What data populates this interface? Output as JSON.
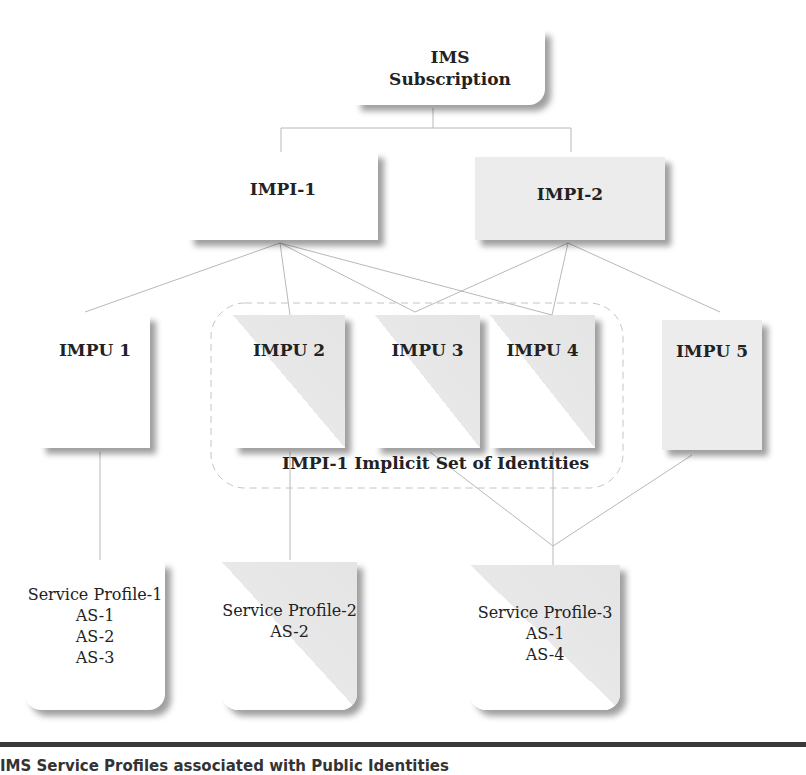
{
  "diagram": {
    "root": {
      "line1": "IMS",
      "line2": "Subscription"
    },
    "private_ids": [
      {
        "label": "IMPI-1"
      },
      {
        "label": "IMPI-2"
      }
    ],
    "public_ids": [
      {
        "label": "IMPU 1"
      },
      {
        "label": "IMPU 2"
      },
      {
        "label": "IMPU 3"
      },
      {
        "label": "IMPU 4"
      },
      {
        "label": "IMPU 5"
      }
    ],
    "implicit_set_label": "IMPI-1 Implicit Set of Identities",
    "service_profiles": [
      {
        "title": "Service Profile-1",
        "servers": [
          "AS-1",
          "AS-2",
          "AS-3"
        ]
      },
      {
        "title": "Service Profile-2",
        "servers": [
          "AS-2"
        ]
      },
      {
        "title": "Service Profile-3",
        "servers": [
          "AS-1",
          "AS-4"
        ]
      }
    ],
    "links": {
      "subscription_to_impi": [
        "IMPI-1",
        "IMPI-2"
      ],
      "IMPI-1": [
        "IMPU 1",
        "IMPU 2",
        "IMPU 3",
        "IMPU 4"
      ],
      "IMPI-2": [
        "IMPU 3",
        "IMPU 4",
        "IMPU 5"
      ],
      "IMPU 1": [
        "Service Profile-1"
      ],
      "IMPU 2": [
        "Service Profile-2"
      ],
      "IMPU 3": [
        "Service Profile-3"
      ],
      "IMPU 4": [
        "Service Profile-3"
      ],
      "IMPU 5": [
        "Service Profile-3"
      ]
    }
  },
  "caption": "IMS Service Profiles associated with Public Identities"
}
